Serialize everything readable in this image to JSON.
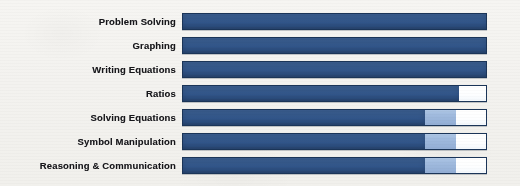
{
  "chart_data": {
    "type": "bar",
    "orientation": "horizontal",
    "stacked": true,
    "title": "",
    "subtitle": "",
    "xlabel": "",
    "ylabel": "",
    "xlim": [
      0,
      100
    ],
    "grid": false,
    "legend": "none",
    "axis_visible": false,
    "tick_labels": [],
    "annotations": [],
    "categories": [
      "Problem Solving",
      "Graphing",
      "Writing Equations",
      "Ratios",
      "Solving Equations",
      "Symbol Manipulation",
      "Reasoning & Communication"
    ],
    "series": [
      {
        "name": "dark-blue",
        "color": "#32568a",
        "values": [
          100,
          100,
          100,
          91,
          80,
          80,
          80
        ]
      },
      {
        "name": "light-blue",
        "color": "#9ab5da",
        "values": [
          0,
          0,
          0,
          0,
          10,
          10,
          10
        ]
      },
      {
        "name": "unfilled",
        "color": "#ffffff",
        "values": [
          0,
          0,
          0,
          9,
          10,
          10,
          10
        ]
      }
    ]
  },
  "style": {
    "background": "#f4f3f0",
    "bar_border": "#1b3558",
    "label_color": "#16161a",
    "dark_blue": "#32568a",
    "light_blue": "#9ab5da",
    "unfilled": "#ffffff"
  }
}
